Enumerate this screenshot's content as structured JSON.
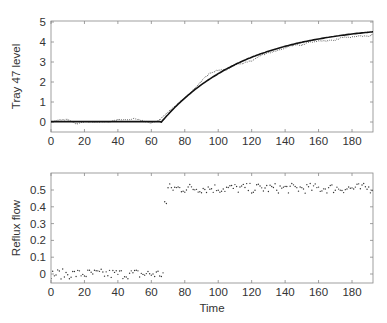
{
  "chart_data": [
    {
      "type": "line",
      "title": "",
      "xlabel": "",
      "ylabel": "Tray 47 level",
      "xlim": [
        0,
        192
      ],
      "ylim": [
        -0.15,
        5
      ],
      "xticks": [
        0,
        20,
        40,
        60,
        80,
        100,
        120,
        140,
        160,
        180
      ],
      "yticks": [
        0,
        1,
        2,
        3,
        4,
        5
      ],
      "grid": false,
      "series": [
        {
          "name": "measured (dotted)",
          "style": "dotted",
          "x": [
            0,
            5,
            10,
            15,
            20,
            25,
            30,
            35,
            40,
            45,
            50,
            55,
            60,
            65,
            70,
            75,
            80,
            85,
            90,
            95,
            100,
            105,
            110,
            115,
            120,
            125,
            130,
            135,
            140,
            145,
            150,
            155,
            160,
            165,
            170,
            175,
            180,
            185,
            190,
            192
          ],
          "values": [
            0.0,
            0.1,
            0.12,
            -0.1,
            0.02,
            0.0,
            0.0,
            0.0,
            0.12,
            0.1,
            0.18,
            0.05,
            -0.05,
            0.1,
            0.5,
            0.85,
            1.2,
            1.6,
            2.05,
            2.45,
            2.6,
            2.6,
            2.85,
            2.95,
            3.05,
            3.3,
            3.45,
            3.55,
            3.7,
            3.85,
            3.85,
            4.0,
            4.05,
            4.05,
            4.1,
            4.25,
            4.25,
            4.3,
            4.3,
            4.35
          ]
        },
        {
          "name": "model fit (solid)",
          "style": "solid",
          "x": [
            0,
            66,
            70,
            80,
            90,
            100,
            110,
            120,
            130,
            140,
            150,
            160,
            170,
            180,
            192
          ],
          "values": [
            0.0,
            0.0,
            0.38,
            1.19,
            1.86,
            2.43,
            2.9,
            3.3,
            3.63,
            3.78,
            4.1,
            4.28,
            4.4,
            4.48,
            4.5
          ]
        }
      ]
    },
    {
      "type": "scatter",
      "title": "",
      "xlabel": "Time",
      "ylabel": "Reflux flow",
      "xlim": [
        0,
        192
      ],
      "ylim": [
        -0.05,
        0.6
      ],
      "xticks": [
        0,
        20,
        40,
        60,
        80,
        100,
        120,
        140,
        160,
        180
      ],
      "yticks": [
        0,
        0.1,
        0.2,
        0.3,
        0.4,
        0.5
      ],
      "grid": false,
      "series": [
        {
          "name": "reflux flow",
          "segments": [
            {
              "x_range": [
                0,
                67
              ],
              "mean": 0.0,
              "spread": 0.03
            },
            {
              "x": 68,
              "value": 0.43
            },
            {
              "x": 69,
              "value": 0.42
            },
            {
              "x_range": [
                70,
                192
              ],
              "mean": 0.51,
              "spread": 0.03
            }
          ]
        }
      ]
    }
  ]
}
